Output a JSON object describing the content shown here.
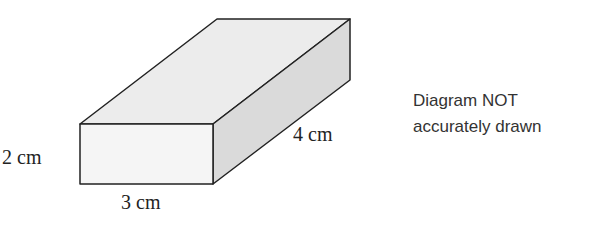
{
  "diagram": {
    "shape": "rectangular-prism",
    "labels": {
      "height": "2 cm",
      "width": "3 cm",
      "depth": "4 cm"
    },
    "note": {
      "line1": "Diagram NOT",
      "line2": "accurately drawn"
    },
    "colors": {
      "front_face": "#f5f5f5",
      "top_face": "#ececec",
      "side_face": "#dadada",
      "edge": "#222222"
    }
  }
}
